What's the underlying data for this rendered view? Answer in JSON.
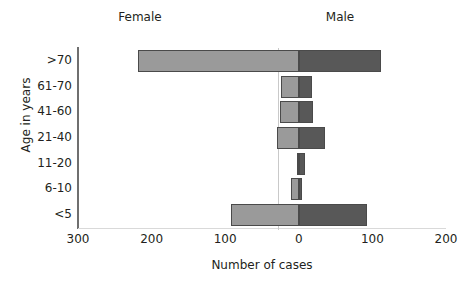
{
  "chart_data": {
    "type": "bar",
    "subtype": "population-pyramid",
    "orientation": "horizontal",
    "title": "",
    "xlabel": "Number of cases",
    "ylabel": "Age in years",
    "categories": [
      ">70",
      "61-70",
      "41-60",
      "21-40",
      "11-20",
      "6-10",
      "<5"
    ],
    "series": [
      {
        "name": "Female",
        "direction": "left",
        "color": "#9a9a9a",
        "values": [
          219,
          24,
          26,
          30,
          3,
          10,
          92
        ]
      },
      {
        "name": "Male",
        "direction": "right",
        "color": "#585858",
        "values": [
          112,
          18,
          19,
          36,
          9,
          4,
          92
        ]
      }
    ],
    "x_tick_labels": [
      "300",
      "200",
      "100",
      "0",
      "100",
      "200"
    ],
    "x_tick_values": [
      -300,
      -200,
      -100,
      0,
      100,
      200
    ],
    "xlim": [
      -300,
      200
    ],
    "grid": false,
    "legend_position": "top-inline",
    "axis_color": "#6f6f6f",
    "bar_border_color": "#4a4a4a"
  },
  "captions": {
    "female": "Female",
    "male": "Male"
  },
  "axes": {
    "y_title": "Age in years",
    "x_title": "Number of cases"
  }
}
